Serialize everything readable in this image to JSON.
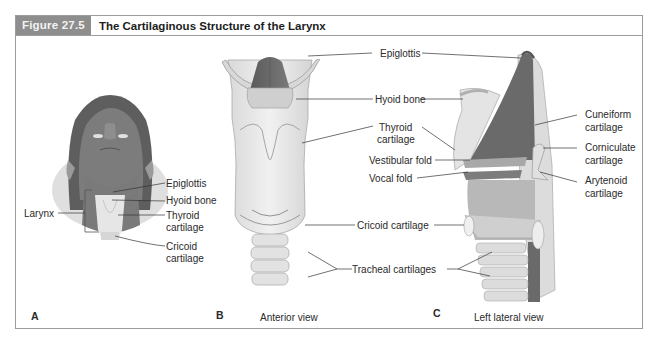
{
  "figure": {
    "number": "Figure 27.5",
    "title": "The Cartilaginous Structure of the Larynx",
    "header_bg": "#8e8e8e"
  },
  "panel_a": {
    "letter": "A",
    "labels": {
      "larynx": "Larynx",
      "epiglottis": "Epiglottis",
      "hyoid": "Hyoid bone",
      "thyroid_1": "Thyroid",
      "thyroid_2": "cartilage",
      "cricoid_1": "Cricoid",
      "cricoid_2": "cartilage"
    }
  },
  "panel_b": {
    "letter": "B",
    "caption": "Anterior view",
    "labels": {
      "epiglottis": "Epiglottis",
      "hyoid": "Hyoid bone",
      "thyroid_1": "Thyroid",
      "thyroid_2": "cartilage",
      "vestibular": "Vestibular fold",
      "vocal": "Vocal fold",
      "cricoid": "Cricoid cartilage",
      "tracheal": "Tracheal cartilages"
    }
  },
  "panel_c": {
    "letter": "C",
    "caption": "Left lateral view",
    "labels": {
      "cuneiform_1": "Cuneiform",
      "cuneiform_2": "cartilage",
      "corniculate_1": "Corniculate",
      "corniculate_2": "cartilage",
      "arytenoid_1": "Arytenoid",
      "arytenoid_2": "cartilage"
    }
  }
}
